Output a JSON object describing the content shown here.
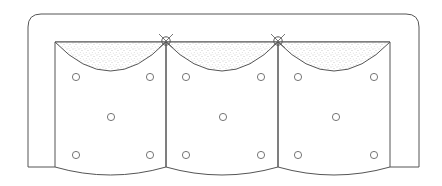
{
  "drawing": {
    "subject": "three-seat sofa plan view",
    "colors": {
      "background": "#ffffff",
      "stroke": "#555555",
      "stipple": "#9a9a9a"
    },
    "outer_frame": {
      "left": 28,
      "top": 14,
      "right": 419,
      "arm_bottom": 167,
      "corner_radius": 13
    },
    "inner_back": {
      "left": 55,
      "top": 42,
      "right": 390
    },
    "dividers_x": [
      166,
      278
    ],
    "seat_bottom": {
      "edge_y": 167,
      "dip_y": 175
    },
    "back_arc_depth_y": 71,
    "pillow_marks": [
      {
        "x": 166,
        "y": 42
      },
      {
        "x": 278,
        "y": 42
      }
    ],
    "seats": [
      {
        "name": "left-seat",
        "x0": 55,
        "x1": 166,
        "buttons": [
          [
            76,
            77
          ],
          [
            150,
            77
          ],
          [
            111,
            117
          ],
          [
            76,
            155
          ],
          [
            150,
            155
          ]
        ]
      },
      {
        "name": "middle-seat",
        "x0": 166,
        "x1": 278,
        "buttons": [
          [
            186,
            77
          ],
          [
            261,
            77
          ],
          [
            223,
            117
          ],
          [
            186,
            155
          ],
          [
            261,
            155
          ]
        ]
      },
      {
        "name": "right-seat",
        "x0": 278,
        "x1": 390,
        "buttons": [
          [
            298,
            77
          ],
          [
            374,
            77
          ],
          [
            336,
            117
          ],
          [
            298,
            155
          ],
          [
            374,
            155
          ]
        ]
      }
    ]
  }
}
